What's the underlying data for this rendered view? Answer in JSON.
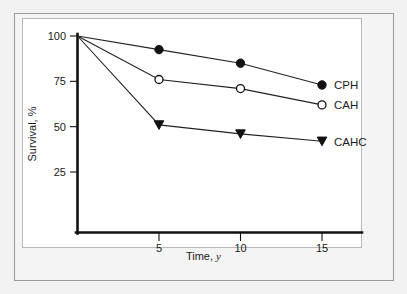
{
  "chart_data": {
    "type": "line",
    "title": "",
    "subtitle": "",
    "xlabel": "Time,",
    "xlabel_italic": "y",
    "ylabel": "Survival, %",
    "x": [
      0,
      5,
      10,
      15
    ],
    "xlim": [
      0,
      17.8
    ],
    "ylim": [
      0,
      104
    ],
    "xticks": [
      5,
      10,
      15
    ],
    "xtick_labels": [
      "5",
      "10",
      "15"
    ],
    "yticks": [
      25,
      50,
      75,
      100
    ],
    "ytick_labels": [
      "25",
      "50",
      "75",
      "100"
    ],
    "grid": false,
    "legend_position": "right-inline",
    "series": [
      {
        "name": "CPH",
        "label": "CPH",
        "marker": "filled-circle",
        "color": "#111111",
        "values": [
          100,
          92.5,
          85,
          73
        ]
      },
      {
        "name": "CAH",
        "label": "CAH",
        "marker": "open-circle",
        "color": "#111111",
        "values": [
          100,
          76,
          71,
          62
        ]
      },
      {
        "name": "CAHC",
        "label": "CAHC",
        "marker": "filled-triangle-down",
        "color": "#111111",
        "values": [
          100,
          51,
          46,
          42
        ]
      }
    ]
  },
  "figure": {
    "background_color": "#f2f2f2",
    "panel_color": "#ffffff",
    "frame_color": "#9a9a9a",
    "axis_color": "#111111"
  }
}
